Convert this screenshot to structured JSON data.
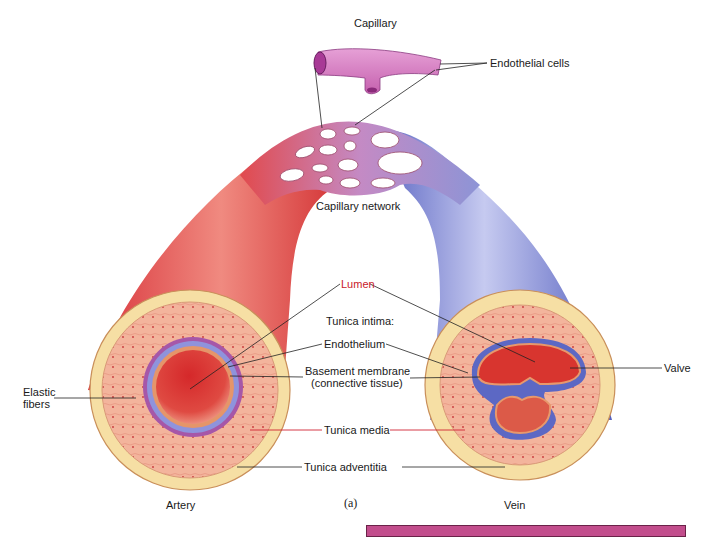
{
  "figure": {
    "panel_label": "(a)",
    "labels": {
      "capillary": "Capillary",
      "endothelial_cells": "Endothelial cells",
      "capillary_network": "Capillary network",
      "lumen": "Lumen",
      "tunica_intima": "Tunica intima:",
      "endothelium": "Endothelium",
      "basement_membrane_1": "Basement membrane",
      "basement_membrane_2": "(connective tissue)",
      "valve": "Valve",
      "elastic_fibers_1": "Elastic",
      "elastic_fibers_2": "fibers",
      "tunica_media": "Tunica media",
      "tunica_adventitia": "Tunica adventitia",
      "artery": "Artery",
      "vein": "Vein"
    },
    "colors": {
      "artery": "#e2474a",
      "vein": "#8088d0",
      "capillary": "#d676c0",
      "adventitia": "#f6dfa4",
      "media": "#f2b79c",
      "lumen": "#d9332f",
      "intima": "#8c8ad8",
      "label_red": "#c8202a",
      "pink_bar": "#c24d8c"
    }
  }
}
